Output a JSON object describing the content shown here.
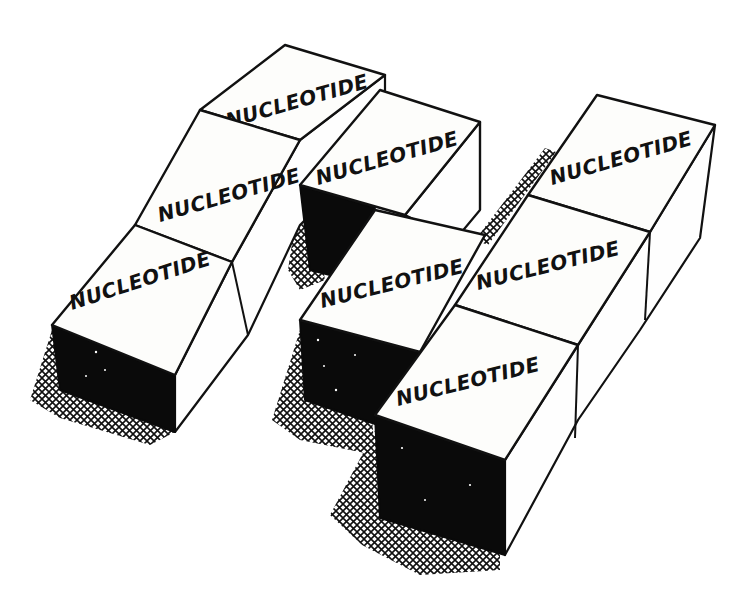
{
  "figure": {
    "colors": {
      "ink": "#111111",
      "paper": "#ffffff",
      "shadow_fill": "#0a0a0a"
    },
    "boxes": [
      {
        "id": "left-top",
        "label": "NUCLEOTIDE"
      },
      {
        "id": "left-middle",
        "label": "NUCLEOTIDE"
      },
      {
        "id": "left-bottom",
        "label": "NUCLEOTIDE"
      },
      {
        "id": "center-top",
        "label": "NUCLEOTIDE"
      },
      {
        "id": "center-bottom",
        "label": "NUCLEOTIDE"
      },
      {
        "id": "right-top",
        "label": "NUCLEOTIDE"
      },
      {
        "id": "right-middle",
        "label": "NUCLEOTIDE"
      },
      {
        "id": "right-bottom",
        "label": "NUCLEOTIDE"
      }
    ]
  }
}
